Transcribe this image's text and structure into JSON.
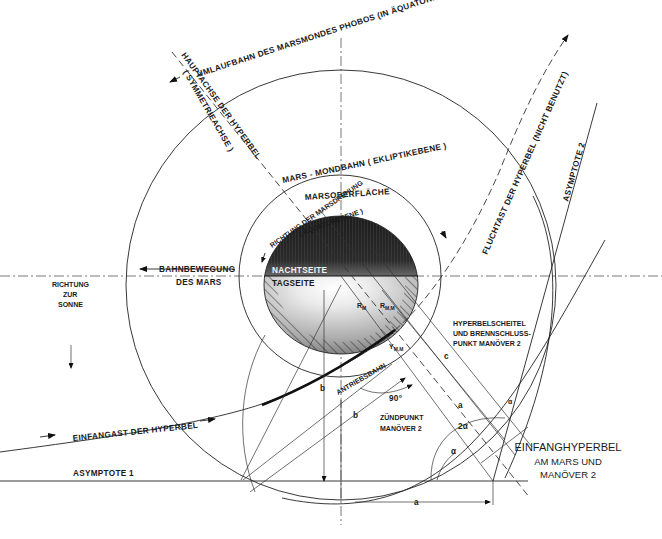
{
  "title": {
    "line1": "EINFANGHYPERBEL",
    "line2": "AM MARS UND",
    "line3": "MANÖVER 2"
  },
  "labels": {
    "phobos_orbit": "UMLAUFBAHN DES MARSMONDES PHOBOS (IN ÄQUATOREBENE DES MARS)",
    "main_axis_1": "HAUPTACHSE DER HYPERBEL",
    "main_axis_2": "( SYMMETRIEACHSE )",
    "mars_moon_orbit": "MARS - MONDBAHN ( EKLIPTIKEBENE )",
    "mars_surface": "MARSOBERFLÄCHE",
    "rotation_1": "RICHTUNG DER MARSDREHUNG",
    "rotation_2": "( ÄQUATOREBENE )",
    "night_side": "NACHTSEITE",
    "day_side": "TAGSEITE",
    "orbital_motion_1": "BAHNBEWEGUNG",
    "orbital_motion_2": "DES MARS",
    "sun_dir_1": "RICHTUNG",
    "sun_dir_2": "ZUR",
    "sun_dir_3": "SONNE",
    "escape_branch": "FLUCHTAST DER HYPERBEL (NICHT BENUTZT)",
    "asymptote_2": "ASYMPTOTE 2",
    "asymptote_1": "ASYMPTOTE  1",
    "capture_branch": "EINFANGAST DER HYPERBEL",
    "vertex_1": "HYPERBELSCHEITEL",
    "vertex_2": "UND BRENNSCHLUSS-",
    "vertex_3": "PUNKT MANÖVER 2",
    "burn_arc": "ANTRIEBSBAHN",
    "ignition_1": "ZÜNDPUNKT",
    "ignition_2": "MANÖVER 2",
    "angle_90": "90°",
    "r_m": "R",
    "r_m_sub": "M",
    "r_mm": "R",
    "r_mm_sub": "M,M",
    "y_mm": "Y",
    "y_mm_sub": "M,M",
    "b": "b",
    "b2": "b",
    "c": "c",
    "a_sym": "a",
    "a_bottom": "a",
    "two_alpha": "2α",
    "alpha_1": "α",
    "alpha_2": "α"
  },
  "colors": {
    "ink": "#1a1a1a",
    "night": "#262626",
    "day_light": "#f2f2f2",
    "day_dark": "#8a8a8a"
  }
}
